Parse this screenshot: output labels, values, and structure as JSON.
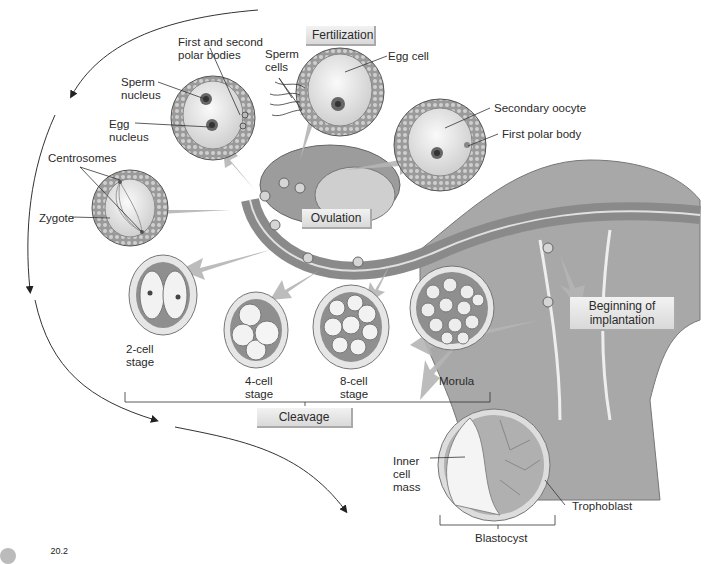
{
  "figure": {
    "number": "20.2",
    "title_boxes": {
      "fertilization": "Fertilization",
      "ovulation": "Ovulation",
      "cleavage": "Cleavage",
      "implantation": "Beginning of\nimplantation"
    },
    "labels": {
      "polar_bodies": "First and second\npolar bodies",
      "sperm_cells": "Sperm\ncells",
      "egg_cell": "Egg cell",
      "sperm_nucleus": "Sperm\nnucleus",
      "egg_nucleus": "Egg\nnucleus",
      "secondary_oocyte": "Secondary oocyte",
      "first_polar_body": "First polar body",
      "centrosomes": "Centrosomes",
      "zygote": "Zygote",
      "two_cell": "2-cell\nstage",
      "four_cell": "4-cell\nstage",
      "eight_cell": "8-cell\nstage",
      "morula": "Morula",
      "inner_cell_mass": "Inner\ncell\nmass",
      "trophoblast": "Trophoblast",
      "blastocyst": "Blastocyst"
    },
    "colors": {
      "tissue_dark": "#7a7a7a",
      "tissue_mid": "#a8a8a8",
      "tissue_light": "#d0d0d0",
      "arrow": "#b5b5b5",
      "line": "#333333"
    }
  }
}
